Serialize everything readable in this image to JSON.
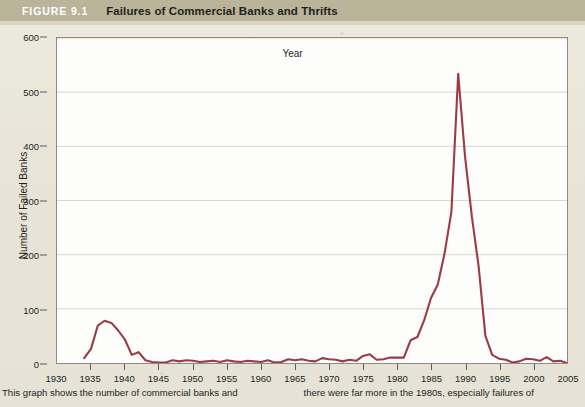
{
  "header": {
    "figure_number": "FIGURE 9.1",
    "title": "Failures of Commercial Banks and Thrifts",
    "band_color": "#b9b49a"
  },
  "caption": {
    "left": "This graph shows the number of commercial banks and",
    "right": "there were far more in the 1980s, especially failures of"
  },
  "chart_data": {
    "type": "line",
    "title": "Failures of Commercial Banks and Thrifts",
    "xlabel": "Year",
    "ylabel": "Number of Failed Banks",
    "xlim": [
      1930,
      2005
    ],
    "ylim": [
      0,
      600
    ],
    "xticks": [
      1930,
      1935,
      1940,
      1945,
      1950,
      1955,
      1960,
      1965,
      1970,
      1975,
      1980,
      1985,
      1990,
      1995,
      2000,
      2005
    ],
    "yticks": [
      0,
      100,
      200,
      300,
      400,
      500,
      600
    ],
    "grid": "horizontal",
    "legend": "none",
    "line_color": "#9b3b45",
    "line_width": 2.1,
    "x": [
      1934,
      1935,
      1936,
      1937,
      1938,
      1939,
      1940,
      1941,
      1942,
      1943,
      1944,
      1945,
      1946,
      1947,
      1948,
      1949,
      1950,
      1951,
      1952,
      1953,
      1954,
      1955,
      1956,
      1957,
      1958,
      1959,
      1960,
      1961,
      1962,
      1963,
      1964,
      1965,
      1966,
      1967,
      1968,
      1969,
      1970,
      1971,
      1972,
      1973,
      1974,
      1975,
      1976,
      1977,
      1978,
      1979,
      1980,
      1981,
      1982,
      1983,
      1984,
      1985,
      1986,
      1987,
      1988,
      1989,
      1990,
      1991,
      1992,
      1993,
      1994,
      1995,
      1996,
      1997,
      1998,
      1999,
      2000,
      2001,
      2002,
      2003,
      2004,
      2005
    ],
    "values": [
      9,
      26,
      69,
      78,
      74,
      60,
      43,
      15,
      20,
      5,
      2,
      1,
      1,
      5,
      3,
      5,
      4,
      2,
      3,
      4,
      2,
      5,
      3,
      2,
      4,
      3,
      2,
      5,
      1,
      2,
      7,
      5,
      7,
      4,
      3,
      9,
      7,
      6,
      3,
      6,
      4,
      13,
      16,
      6,
      7,
      10,
      10,
      10,
      42,
      48,
      79,
      120,
      145,
      203,
      279,
      534,
      382,
      271,
      179,
      50,
      15,
      8,
      6,
      1,
      3,
      8,
      7,
      4,
      11,
      3,
      4,
      0
    ],
    "annotations": [
      {
        "label": "Great Depression era peak",
        "x": 1937,
        "y": 78
      },
      {
        "label": "Early 1980s rise",
        "x": 1982,
        "y": 110
      },
      {
        "label": "S&L crisis peak",
        "x": 1989,
        "y": 534
      }
    ]
  }
}
